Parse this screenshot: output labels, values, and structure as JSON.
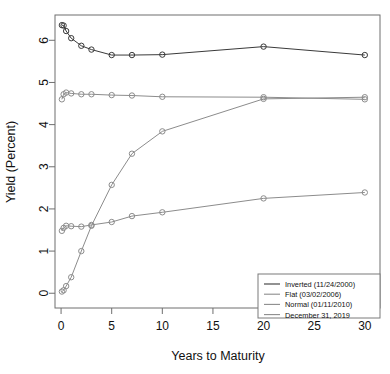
{
  "chart_data": {
    "type": "line",
    "title": "",
    "xlabel": "Years to Maturity",
    "ylabel": "Yield (Percent)",
    "xlim": [
      -0.6,
      31.5
    ],
    "ylim": [
      -0.35,
      6.6
    ],
    "xticks": [
      0,
      5,
      10,
      15,
      20,
      25,
      30
    ],
    "yticks": [
      0,
      1,
      2,
      3,
      4,
      5,
      6
    ],
    "xtick_labels": [
      "0",
      "5",
      "10",
      "15",
      "20",
      "25",
      "30"
    ],
    "ytick_labels": [
      "0",
      "1",
      "2",
      "3",
      "4",
      "5",
      "6"
    ],
    "grid": false,
    "legend_position": "bottom-right",
    "series": [
      {
        "name": "Inverted (11/24/2000)",
        "color": "#3a3a3a",
        "marker": "circle",
        "x": [
          0.08,
          0.25,
          0.5,
          1,
          2,
          3,
          5,
          7,
          10,
          20,
          30
        ],
        "y": [
          6.36,
          6.35,
          6.22,
          6.05,
          5.87,
          5.78,
          5.65,
          5.65,
          5.66,
          5.85,
          5.65
        ]
      },
      {
        "name": "Flat (03/02/2006)",
        "color": "#8c8c8c",
        "marker": "circle",
        "x": [
          0.08,
          0.25,
          0.5,
          1,
          2,
          3,
          5,
          7,
          10,
          20,
          30
        ],
        "y": [
          4.6,
          4.72,
          4.76,
          4.74,
          4.72,
          4.72,
          4.7,
          4.69,
          4.66,
          4.65,
          4.6
        ]
      },
      {
        "name": "Normal (01/11/2010)",
        "color": "#8c8c8c",
        "marker": "circle",
        "x": [
          0.08,
          0.25,
          0.5,
          1,
          2,
          3,
          5,
          7,
          10,
          20,
          30
        ],
        "y": [
          0.04,
          0.07,
          0.17,
          0.38,
          1.0,
          1.6,
          2.57,
          3.31,
          3.84,
          4.61,
          4.65
        ]
      },
      {
        "name": "December 31, 2019",
        "color": "#8c8c8c",
        "marker": "circle",
        "x": [
          0.08,
          0.25,
          0.5,
          1,
          2,
          3,
          5,
          7,
          10,
          20,
          30
        ],
        "y": [
          1.48,
          1.55,
          1.6,
          1.59,
          1.58,
          1.62,
          1.69,
          1.83,
          1.92,
          2.25,
          2.39
        ]
      }
    ]
  },
  "legend": {
    "items": [
      {
        "label": "Inverted (11/24/2000)",
        "color": "#3a3a3a"
      },
      {
        "label": "Flat (03/02/2006)",
        "color": "#8c8c8c"
      },
      {
        "label": "Normal (01/11/2010)",
        "color": "#8c8c8c"
      },
      {
        "label": "December 31, 2019",
        "color": "#8c8c8c"
      }
    ]
  },
  "axes": {
    "x_title": "Years to Maturity",
    "y_title": "Yield (Percent)"
  }
}
